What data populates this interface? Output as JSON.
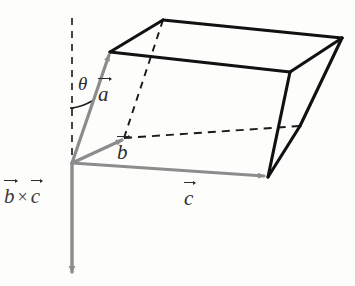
{
  "figure": {
    "background_color": "#fdfdfc",
    "labels": {
      "vector_a": "a",
      "vector_b": "b",
      "vector_c": "c",
      "angle_theta": "θ",
      "cross_product_b": "b",
      "cross_product_operator": "×",
      "cross_product_c": "c"
    },
    "colors": {
      "solid_edge": "#111111",
      "hidden_edge": "#1a1a1a",
      "vector_gray": "#8c8c8c",
      "vector_gray_dark": "#7a7a7a",
      "reference_dash": "#3d3d3d",
      "label_text": "#2b2b2b",
      "angle_arc": "#1f1f1f"
    },
    "geometry": {
      "origin": [
        72,
        163
      ],
      "vector_a_tip": [
        110,
        52
      ],
      "vector_b_tip": [
        124,
        138
      ],
      "vector_c_tip": [
        268,
        177
      ],
      "cross_product_tip": [
        72,
        278
      ],
      "reference_line_top": [
        72,
        18
      ],
      "top_face": [
        [
          110,
          52
        ],
        [
          163,
          20
        ],
        [
          342,
          38
        ],
        [
          290,
          72
        ]
      ],
      "bottom_front_vertex": [
        268,
        177
      ],
      "hidden_vertex": [
        124,
        138
      ],
      "right_lower_vertex": [
        300,
        126
      ]
    }
  }
}
